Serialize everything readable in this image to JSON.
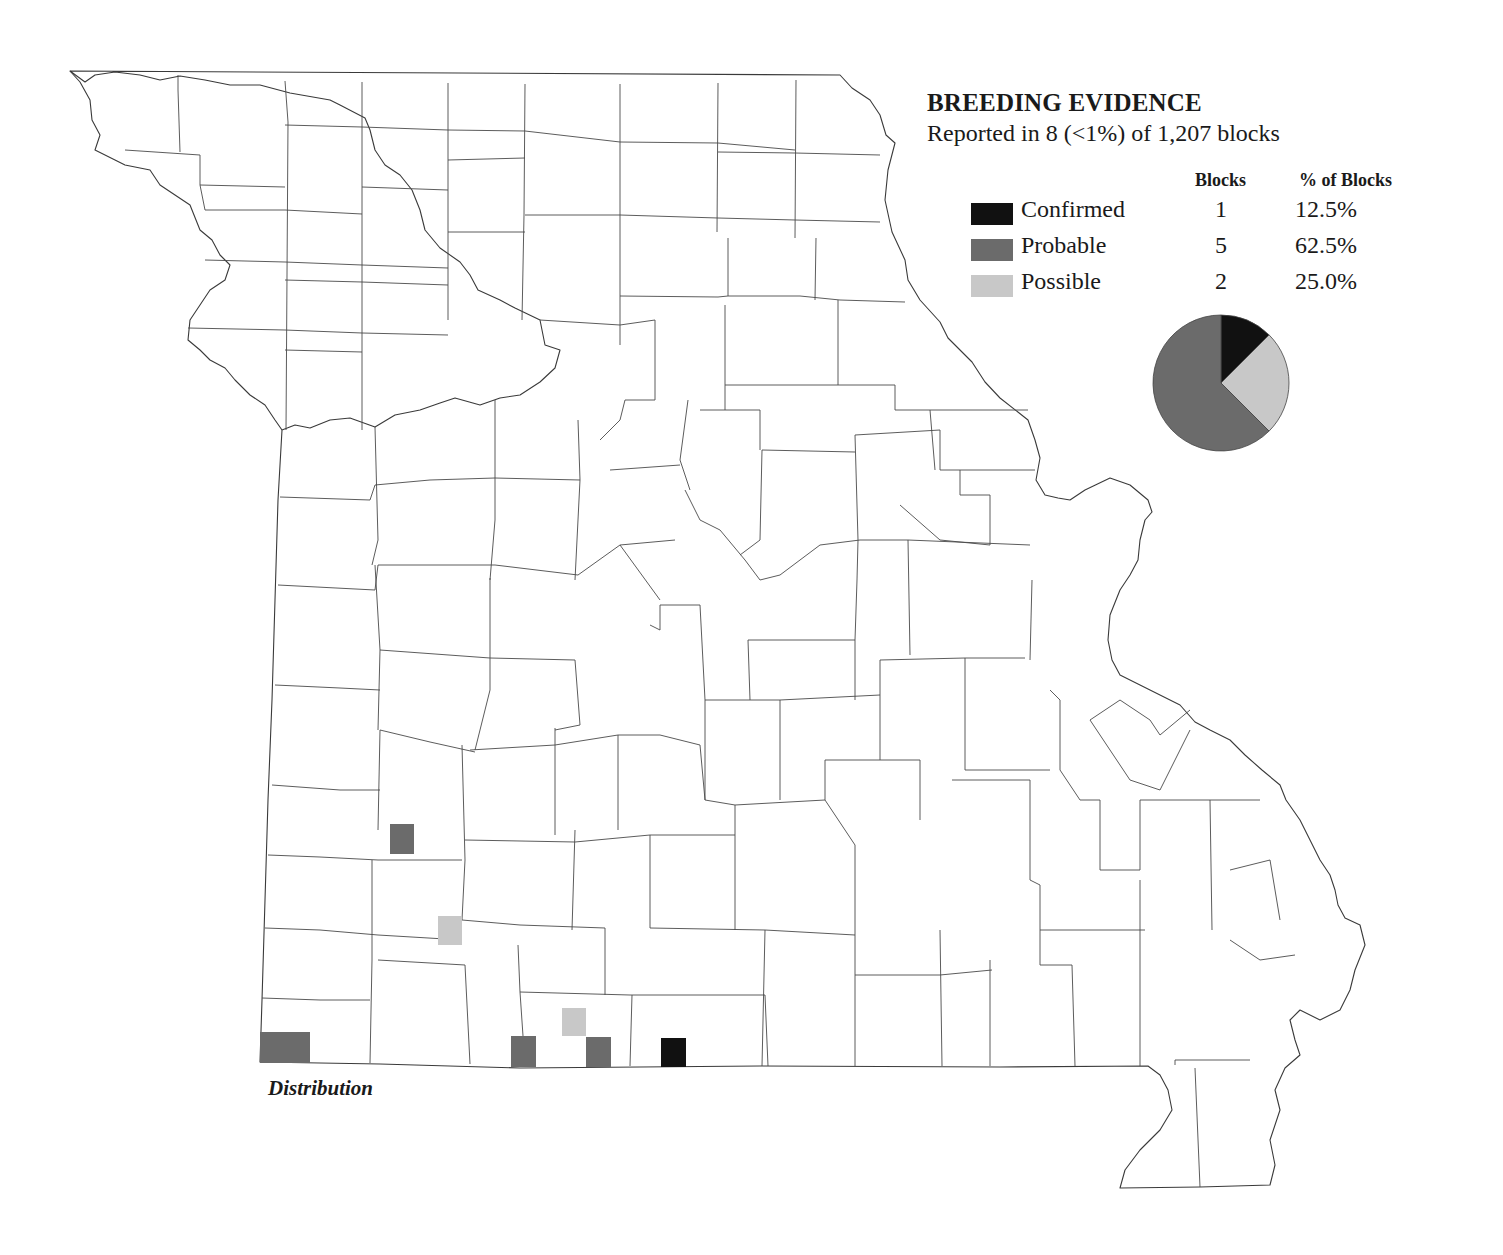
{
  "legend": {
    "title": "BREEDING EVIDENCE",
    "subtitle": "Reported in 8 (<1%) of 1,207 blocks",
    "columns": {
      "blocks": "Blocks",
      "percent": "% of Blocks"
    },
    "rows": [
      {
        "label": "Confirmed",
        "blocks": "1",
        "percent": "12.5%",
        "color": "#111111"
      },
      {
        "label": "Probable",
        "blocks": "5",
        "percent": "62.5%",
        "color": "#6b6b6b"
      },
      {
        "label": "Possible",
        "blocks": "2",
        "percent": "25.0%",
        "color": "#c8c8c8"
      }
    ]
  },
  "map": {
    "caption": "Distribution",
    "blocks": [
      {
        "category": "Probable",
        "x": 390,
        "y": 824,
        "w": 24,
        "h": 30
      },
      {
        "category": "Possible",
        "x": 438,
        "y": 916,
        "w": 24,
        "h": 29
      },
      {
        "category": "Probable",
        "x": 260,
        "y": 1032,
        "w": 50,
        "h": 31
      },
      {
        "category": "Probable",
        "x": 511,
        "y": 1036,
        "w": 25,
        "h": 31
      },
      {
        "category": "Possible",
        "x": 562,
        "y": 1008,
        "w": 24,
        "h": 28
      },
      {
        "category": "Probable",
        "x": 586,
        "y": 1037,
        "w": 25,
        "h": 30
      },
      {
        "category": "Confirmed",
        "x": 661,
        "y": 1038,
        "w": 25,
        "h": 29
      }
    ]
  },
  "chart_data": {
    "type": "pie",
    "title": "BREEDING EVIDENCE",
    "subtitle": "Reported in 8 (<1%) of 1,207 blocks",
    "categories": [
      "Confirmed",
      "Probable",
      "Possible"
    ],
    "values": [
      1,
      5,
      2
    ],
    "percentages": [
      12.5,
      62.5,
      25.0
    ],
    "colors": [
      "#111111",
      "#6b6b6b",
      "#c8c8c8"
    ],
    "start_angle": "12 o'clock, clockwise order: Confirmed, Possible, Probable"
  }
}
